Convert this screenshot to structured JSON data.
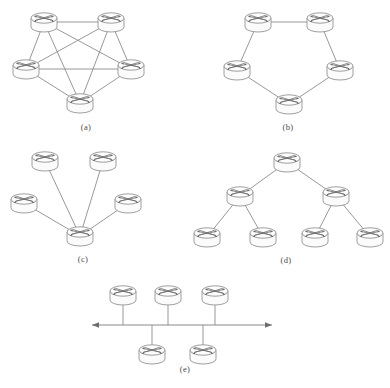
{
  "figure": {
    "background_color": "#ffffff",
    "line_color": "#8c8c8c",
    "node_fill": "#fbfbfb",
    "node_stroke": "#8e8e8e",
    "caption_color": "#4a4a4a",
    "node_icon_name": "router-icon",
    "node_icon_description": "cylinder with crossing directional arrows"
  },
  "panels": [
    {
      "id": "a",
      "caption": "(a)",
      "topology": "full-mesh",
      "caption_x": 86,
      "caption_y": 130,
      "node_count": 5,
      "nodes": [
        {
          "name": "node-a1",
          "x": 44,
          "y": 22
        },
        {
          "name": "node-a2",
          "x": 111,
          "y": 22
        },
        {
          "name": "node-a3",
          "x": 26,
          "y": 69
        },
        {
          "name": "node-a4",
          "x": 131,
          "y": 69
        },
        {
          "name": "node-a5",
          "x": 80,
          "y": 103
        }
      ],
      "edges": [
        [
          0,
          1
        ],
        [
          0,
          2
        ],
        [
          0,
          3
        ],
        [
          0,
          4
        ],
        [
          1,
          2
        ],
        [
          1,
          3
        ],
        [
          1,
          4
        ],
        [
          2,
          3
        ],
        [
          2,
          4
        ],
        [
          3,
          4
        ]
      ]
    },
    {
      "id": "b",
      "caption": "(b)",
      "topology": "ring",
      "caption_x": 288,
      "caption_y": 130,
      "node_count": 5,
      "nodes": [
        {
          "name": "node-b1",
          "x": 258,
          "y": 22
        },
        {
          "name": "node-b2",
          "x": 320,
          "y": 22
        },
        {
          "name": "node-b3",
          "x": 237,
          "y": 70
        },
        {
          "name": "node-b4",
          "x": 340,
          "y": 70
        },
        {
          "name": "node-b5",
          "x": 289,
          "y": 104
        }
      ],
      "edges": [
        [
          0,
          1
        ],
        [
          0,
          2
        ],
        [
          1,
          3
        ],
        [
          2,
          4
        ],
        [
          3,
          4
        ]
      ]
    },
    {
      "id": "c",
      "caption": "(c)",
      "topology": "star",
      "caption_x": 83,
      "caption_y": 262,
      "node_count": 5,
      "nodes": [
        {
          "name": "node-c-hub",
          "x": 80,
          "y": 236
        },
        {
          "name": "node-c-leaf1",
          "x": 45,
          "y": 161
        },
        {
          "name": "node-c-leaf2",
          "x": 103,
          "y": 161
        },
        {
          "name": "node-c-leaf3",
          "x": 24,
          "y": 203
        },
        {
          "name": "node-c-leaf4",
          "x": 128,
          "y": 203
        }
      ],
      "edges": [
        [
          0,
          1
        ],
        [
          0,
          2
        ],
        [
          0,
          3
        ],
        [
          0,
          4
        ]
      ]
    },
    {
      "id": "d",
      "caption": "(d)",
      "topology": "tree",
      "caption_x": 286,
      "caption_y": 263,
      "node_count": 7,
      "nodes": [
        {
          "name": "node-d-root",
          "x": 287,
          "y": 162
        },
        {
          "name": "node-d-mid1",
          "x": 240,
          "y": 196
        },
        {
          "name": "node-d-mid2",
          "x": 336,
          "y": 196
        },
        {
          "name": "node-d-leaf1",
          "x": 207,
          "y": 237
        },
        {
          "name": "node-d-leaf2",
          "x": 263,
          "y": 237
        },
        {
          "name": "node-d-leaf3",
          "x": 315,
          "y": 237
        },
        {
          "name": "node-d-leaf4",
          "x": 370,
          "y": 237
        }
      ],
      "edges": [
        [
          0,
          1
        ],
        [
          0,
          2
        ],
        [
          1,
          3
        ],
        [
          1,
          4
        ],
        [
          2,
          5
        ],
        [
          2,
          6
        ]
      ]
    },
    {
      "id": "e",
      "caption": "(e)",
      "topology": "bus",
      "caption_x": 185,
      "caption_y": 372,
      "node_count": 5,
      "bus": {
        "name": "bus-backbone",
        "x1": 92,
        "x2": 272,
        "y": 325,
        "arrow_left": true,
        "arrow_right": true
      },
      "nodes": [
        {
          "name": "node-e-top1",
          "x": 123,
          "y": 295,
          "side": "above"
        },
        {
          "name": "node-e-top2",
          "x": 168,
          "y": 295,
          "side": "above"
        },
        {
          "name": "node-e-top3",
          "x": 215,
          "y": 295,
          "side": "above"
        },
        {
          "name": "node-e-bottom1",
          "x": 152,
          "y": 354,
          "side": "below"
        },
        {
          "name": "node-e-bottom2",
          "x": 203,
          "y": 354,
          "side": "below"
        }
      ]
    }
  ]
}
